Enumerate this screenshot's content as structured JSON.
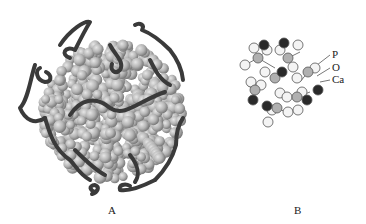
{
  "panels": [
    {
      "id": "A",
      "label": "A",
      "description": "Space-filling sphere cluster surrounded by dark strand loops"
    },
    {
      "id": "B",
      "label": "B",
      "description": "Ball-and-stick cluster of atoms"
    }
  ],
  "legend": {
    "items": [
      {
        "label": "P",
        "color": "#b0b0b0"
      },
      {
        "label": "O",
        "color": "#f4f4f4"
      },
      {
        "label": "Ca",
        "color": "#2a2a2a"
      }
    ]
  },
  "colors": {
    "sphere": "#b8b8b8",
    "strand": "#3a3a3a"
  }
}
